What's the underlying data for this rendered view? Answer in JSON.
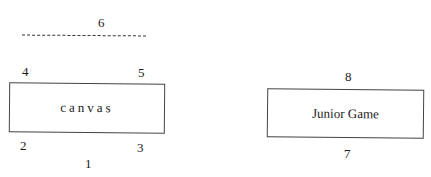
{
  "diagram": {
    "labels": {
      "n1": "1",
      "n2": "2",
      "n3": "3",
      "n4": "4",
      "n5": "5",
      "n6": "6",
      "n7": "7",
      "n8": "8"
    },
    "boxes": {
      "canvas": "canvas",
      "junior_game": "Junior Game"
    },
    "colors": {
      "background": "#ffffff",
      "stroke": "#444444",
      "text": "#1a1a1a"
    }
  }
}
